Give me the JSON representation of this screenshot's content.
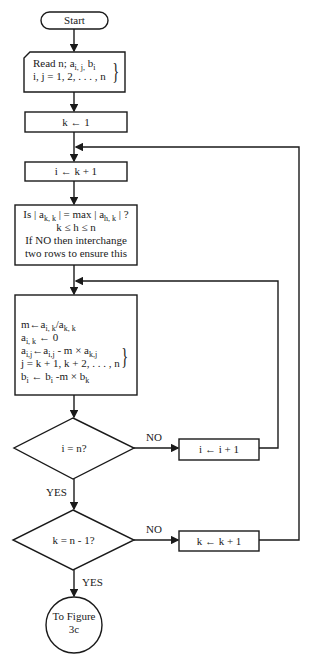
{
  "flowchart": {
    "start": {
      "label": "Start"
    },
    "read": {
      "line1": "Read n; a",
      "line1_sub1": "i, j,",
      "line1_b": " b",
      "line1_sub2": "i",
      "line2": "i, j = 1, 2, . . . , n"
    },
    "init_k": {
      "label": "k ← 1"
    },
    "init_i": {
      "label": "i ← k + 1"
    },
    "pivot": {
      "line1_a": "Is | a",
      "line1_sub1": "k, k",
      "line1_b": " | = max | a",
      "line1_sub2": "h, k",
      "line1_c": " | ?",
      "line2": "k ≤ h ≤ n",
      "line3": "If NO then interchange",
      "line4": "two rows to ensure this"
    },
    "eliminate": {
      "line1": "m←a",
      "line1_s1": "i, k",
      "line1_m": "/a",
      "line1_s2": "k, k",
      "line2": "a",
      "line2_s": "i, k",
      "line2_r": " ← 0",
      "line3": "a",
      "line3_s1": "i,j",
      "line3_m": "←a",
      "line3_s2": "i,j",
      "line3_r": " - m × a",
      "line3_s3": "k,j",
      "line4": "j = k + 1, k + 2, . . . , n",
      "line5": "b",
      "line5_s1": "i",
      "line5_m": " ← b",
      "line5_s2": "i",
      "line5_r": " -m × b",
      "line5_s3": "k"
    },
    "decision_i": {
      "label": "i = n?",
      "no": "NO",
      "yes": "YES"
    },
    "inc_i": {
      "label": "i ← i + 1"
    },
    "decision_k": {
      "label": "k = n - 1?",
      "no": "NO",
      "yes": "YES"
    },
    "inc_k": {
      "label": "k ← k + 1"
    },
    "connector": {
      "line1": "To Figure",
      "line2": "3c"
    }
  }
}
